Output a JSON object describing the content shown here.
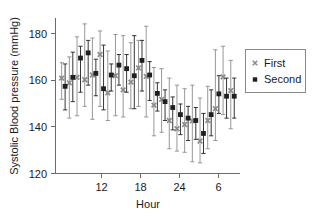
{
  "chart_data": {
    "type": "scatter",
    "title": "",
    "xlabel": "Hour",
    "ylabel": "Systolic Blood pressure (mmHg)",
    "xlim": [
      8.2,
      32.2
    ],
    "ylim": [
      120,
      186
    ],
    "yticks": [
      120,
      140,
      160,
      180
    ],
    "xticks": [
      12,
      18,
      24,
      30
    ],
    "xtick_labels": [
      "12",
      "18",
      "24",
      "6"
    ],
    "grid": false,
    "legend_position": "right",
    "errorbars": true,
    "series": [
      {
        "name": "First",
        "marker": "x",
        "color": "#8c8c8c",
        "x": [
          9.0,
          10.0,
          11.0,
          12.0,
          13.0,
          14.0,
          15.0,
          16.0,
          17.0,
          18.0,
          19.0,
          20.0,
          21.0,
          22.0,
          23.0,
          24.0,
          25.0,
          26.0,
          27.0,
          28.0,
          29.0,
          30.0,
          31.0
        ],
        "values": [
          160.5,
          158.5,
          160.8,
          159.8,
          161.8,
          170.5,
          154.2,
          161.5,
          155.5,
          158.8,
          164.8,
          161.2,
          149.0,
          151.5,
          142.5,
          139.0,
          140.8,
          142.3,
          133.8,
          142.5,
          147.5,
          161.0,
          155.2
        ],
        "err_upper": [
          167.0,
          169.5,
          178.0,
          183.5,
          177.5,
          180.5,
          172.0,
          179.0,
          178.5,
          175.5,
          176.5,
          182.5,
          165.0,
          164.5,
          160.5,
          157.5,
          156.0,
          157.5,
          152.0,
          157.0,
          172.5,
          174.0,
          168.0
        ],
        "err_lower": [
          151.5,
          143.5,
          144.5,
          148.5,
          143.0,
          148.5,
          142.5,
          144.5,
          144.0,
          147.5,
          148.5,
          144.0,
          136.0,
          137.5,
          130.5,
          129.5,
          129.0,
          125.0,
          124.5,
          130.5,
          134.0,
          145.0,
          139.0
        ]
      },
      {
        "name": "Second",
        "marker": "square",
        "color": "#1f1f1f",
        "x": [
          9.45,
          10.45,
          11.45,
          12.45,
          13.45,
          14.45,
          15.45,
          16.45,
          17.45,
          18.45,
          19.45,
          20.45,
          21.45,
          22.45,
          23.45,
          24.45,
          25.45,
          26.45,
          27.45,
          28.45,
          29.45,
          30.45,
          31.45
        ],
        "values": [
          157.0,
          160.8,
          169.0,
          171.2,
          162.5,
          156.0,
          161.8,
          166.0,
          164.5,
          161.5,
          168.0,
          161.8,
          154.0,
          150.5,
          148.0,
          145.0,
          143.5,
          142.5,
          137.0,
          145.0,
          153.8,
          152.8,
          152.8
        ],
        "err_upper": [
          166.5,
          171.5,
          174.0,
          176.5,
          168.5,
          174.5,
          166.5,
          170.5,
          170.5,
          178.5,
          176.5,
          167.5,
          158.5,
          155.5,
          152.5,
          149.5,
          148.5,
          148.0,
          145.5,
          155.5,
          161.5,
          160.5,
          160.5
        ],
        "err_lower": [
          147.0,
          150.5,
          154.5,
          157.5,
          153.0,
          147.0,
          155.0,
          157.5,
          154.5,
          147.5,
          155.0,
          151.0,
          146.5,
          142.5,
          138.5,
          136.5,
          134.0,
          134.5,
          128.5,
          136.0,
          145.5,
          143.5,
          143.5
        ]
      }
    ]
  },
  "legend": {
    "items": [
      {
        "label": "First",
        "marker": "x",
        "color": "#8c8c8c"
      },
      {
        "label": "Second",
        "marker": "square",
        "color": "#1f1f1f"
      }
    ]
  },
  "axes": {
    "ylabel": "Systolic Blood pressure (mmHg)",
    "xlabel": "Hour",
    "ytick_labels": [
      "180",
      "160",
      "140",
      "120"
    ],
    "xtick_labels": [
      "12",
      "18",
      "24",
      "6"
    ]
  }
}
